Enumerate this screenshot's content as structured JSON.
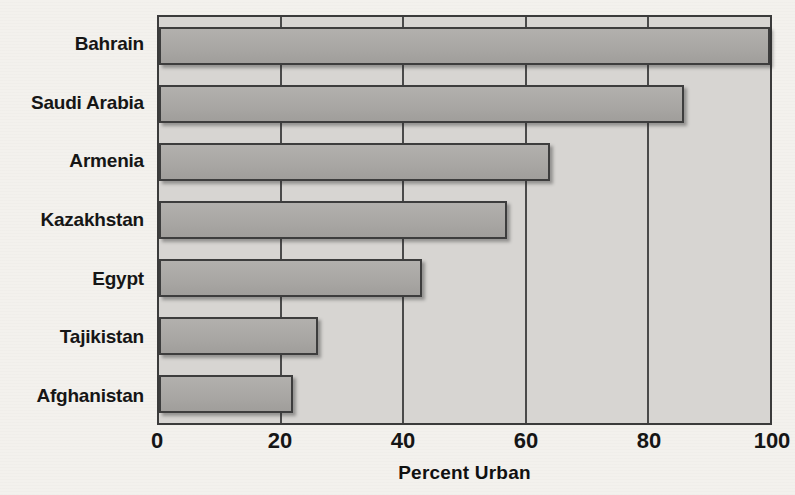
{
  "chart_data": {
    "type": "bar",
    "orientation": "horizontal",
    "title": "",
    "xlabel": "Percent Urban",
    "ylabel": "",
    "xlim": [
      0,
      100
    ],
    "xticks": [
      0,
      20,
      40,
      60,
      80,
      100
    ],
    "xtick_labels": [
      "0",
      "20",
      "40",
      "60",
      "80",
      "100"
    ],
    "grid": "vertical",
    "legend": "none",
    "categories": [
      "Bahrain",
      "Saudi Arabia",
      "Armenia",
      "Kazakhstan",
      "Egypt",
      "Tajikistan",
      "Afghanistan"
    ],
    "values": [
      100,
      86,
      64,
      57,
      43,
      26,
      22
    ],
    "bars": [
      {
        "label": "Bahrain",
        "value": 100
      },
      {
        "label": "Saudi Arabia",
        "value": 86
      },
      {
        "label": "Armenia",
        "value": 64
      },
      {
        "label": "Kazakhstan",
        "value": 57
      },
      {
        "label": "Egypt",
        "value": 43
      },
      {
        "label": "Tajikistan",
        "value": 26
      },
      {
        "label": "Afghanistan",
        "value": 22
      }
    ]
  },
  "colors": {
    "page_background": "#f3f1ed",
    "plot_background": "#d7d5d2",
    "bar_fill": "#a9a7a4",
    "bar_border": "#3d3d3d",
    "axis": "#3b3b3b",
    "gridline": "#4a4a4a",
    "text": "#151515"
  }
}
